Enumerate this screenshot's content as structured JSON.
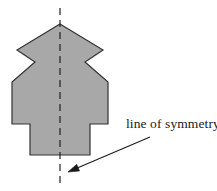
{
  "figure": {
    "background_color": "#ffffff",
    "annotation": {
      "label": "line of symmetry",
      "text_color": "#1a1a1a",
      "font_size_px": 13.5,
      "text_x": 126,
      "text_baseline_y": 128
    },
    "shape": {
      "name": "symmetric-polygon",
      "fill_color": "#a8a8a8",
      "stroke_color": "#333333",
      "stroke_width": 1.2,
      "points": "60,24 103,50 85,62 108,82 108,124 90,124 90,155 30,155 30,124 12,124 12,82 35,62 17,50",
      "vertices": [
        {
          "x": 60,
          "y": 24,
          "name": "apex"
        },
        {
          "x": 103,
          "y": 50,
          "name": "right-shoulder-outer"
        },
        {
          "x": 85,
          "y": 62,
          "name": "right-waist-inner"
        },
        {
          "x": 108,
          "y": 82,
          "name": "right-hip-outer"
        },
        {
          "x": 108,
          "y": 124,
          "name": "right-wing-corner"
        },
        {
          "x": 90,
          "y": 124,
          "name": "right-step"
        },
        {
          "x": 90,
          "y": 155,
          "name": "bottom-right"
        },
        {
          "x": 30,
          "y": 155,
          "name": "bottom-left"
        },
        {
          "x": 30,
          "y": 124,
          "name": "left-step"
        },
        {
          "x": 12,
          "y": 124,
          "name": "left-wing-corner"
        },
        {
          "x": 12,
          "y": 82,
          "name": "left-hip-outer"
        },
        {
          "x": 35,
          "y": 62,
          "name": "left-waist-inner"
        },
        {
          "x": 17,
          "y": 50,
          "name": "left-shoulder-outer"
        }
      ]
    },
    "symmetry_line": {
      "name": "vertical-dashed-axis",
      "x": 60,
      "y_start": 8,
      "y_end": 185,
      "color": "#222222",
      "stroke_width": 1.2,
      "dash_pattern": "7,5"
    },
    "arrow": {
      "name": "annotation-arrow",
      "start_x": 150,
      "start_y": 137,
      "end_x": 68,
      "end_y": 172,
      "color": "#1a1a1a",
      "stroke_width": 1.1
    }
  }
}
